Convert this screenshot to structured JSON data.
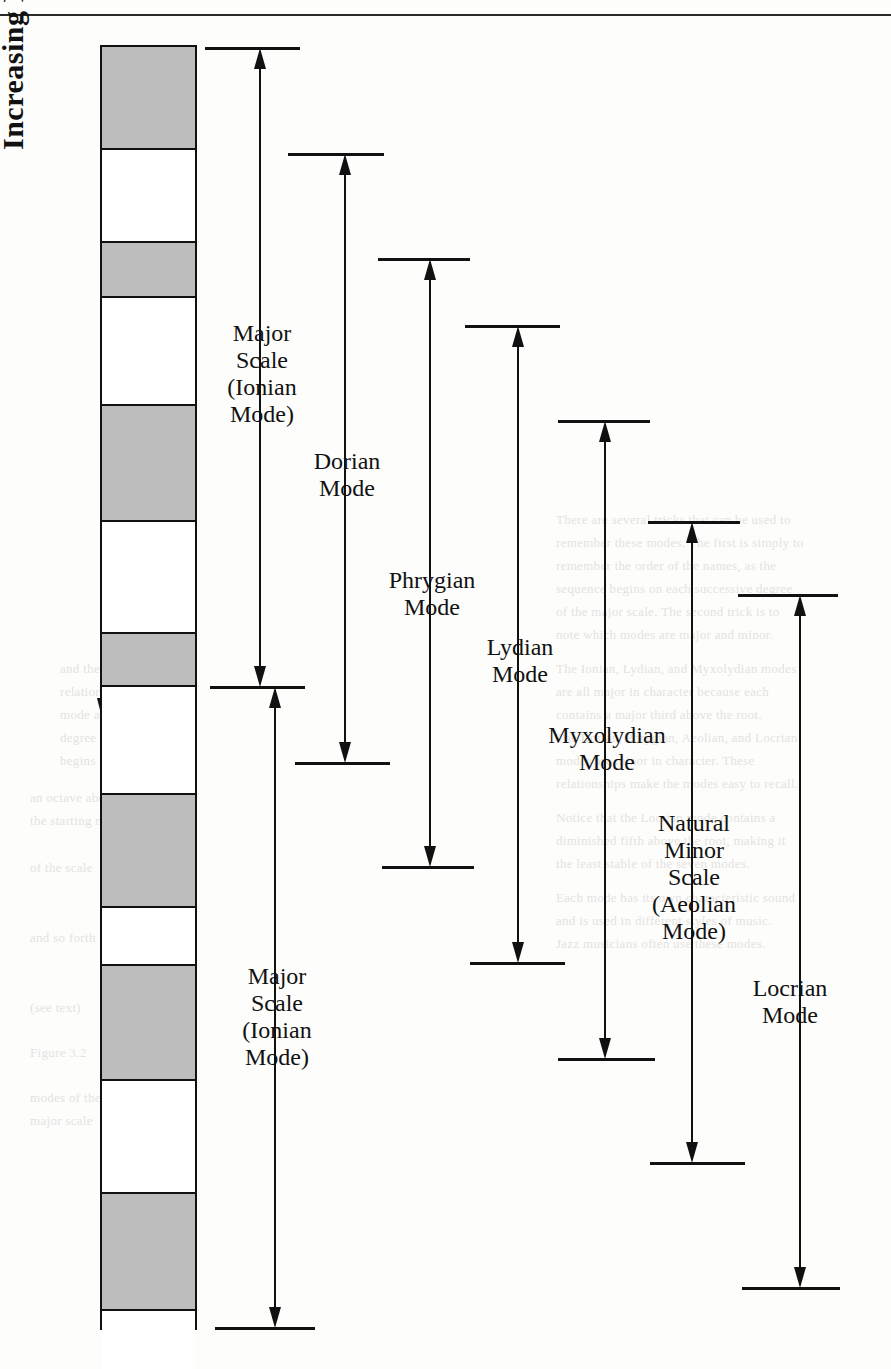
{
  "page": {
    "running_head": "",
    "pitch_axis_label": "Increasing Pitch"
  },
  "chart_data": {
    "type": "diagram",
    "title": "Increasing Pitch",
    "ladder": {
      "x": 100,
      "y": 45,
      "width": 97,
      "height": 1285,
      "segment_count": 13,
      "segments": [
        {
          "index": 0,
          "fill": "gray",
          "height": 103
        },
        {
          "index": 1,
          "fill": "white",
          "height": 93
        },
        {
          "index": 2,
          "fill": "gray",
          "height": 55
        },
        {
          "index": 3,
          "fill": "white",
          "height": 108
        },
        {
          "index": 4,
          "fill": "gray",
          "height": 116
        },
        {
          "index": 5,
          "fill": "white",
          "height": 112
        },
        {
          "index": 6,
          "fill": "gray",
          "height": 53
        },
        {
          "index": 7,
          "fill": "white",
          "height": 108
        },
        {
          "index": 8,
          "fill": "gray",
          "height": 113
        },
        {
          "index": 9,
          "fill": "white",
          "height": 58
        },
        {
          "index": 10,
          "fill": "gray",
          "height": 115
        },
        {
          "index": 11,
          "fill": "white",
          "height": 113
        },
        {
          "index": 12,
          "fill": "gray",
          "height": 117
        },
        {
          "index": 13,
          "fill": "white",
          "height": 58
        }
      ],
      "fill_colors": {
        "gray": "#bdbdbd",
        "white": "#ffffff",
        "outline": "#111111"
      }
    },
    "modes": [
      {
        "id": "major-ionian-upper",
        "label": "Major\nScale\n(Ionian\nMode)",
        "label_lines": [
          "Major",
          "Scale",
          "(Ionian",
          "Mode)"
        ],
        "axis_x": 260,
        "top_y": 47,
        "bottom_y": 686,
        "top_tick": {
          "x1": 205,
          "x2": 300
        },
        "bottom_tick": {
          "x1": 210,
          "x2": 305
        },
        "arrow_top": true,
        "arrow_bottom": true,
        "label_x": 262,
        "label_y": 320
      },
      {
        "id": "dorian",
        "label": "Dorian\nMode",
        "label_lines": [
          "Dorian",
          "Mode"
        ],
        "axis_x": 345,
        "top_y": 153,
        "bottom_y": 762,
        "top_tick": {
          "x1": 288,
          "x2": 384
        },
        "bottom_tick": {
          "x1": 295,
          "x2": 390
        },
        "arrow_top": true,
        "arrow_bottom": true,
        "label_x": 347,
        "label_y": 448
      },
      {
        "id": "phrygian",
        "label": "Phrygian\nMode",
        "label_lines": [
          "Phrygian",
          "Mode"
        ],
        "axis_x": 430,
        "top_y": 258,
        "bottom_y": 866,
        "top_tick": {
          "x1": 378,
          "x2": 470
        },
        "bottom_tick": {
          "x1": 382,
          "x2": 474
        },
        "arrow_top": true,
        "arrow_bottom": true,
        "label_x": 432,
        "label_y": 567
      },
      {
        "id": "lydian",
        "label": "Lydian\nMode",
        "label_lines": [
          "Lydian",
          "Mode"
        ],
        "axis_x": 518,
        "top_y": 325,
        "bottom_y": 962,
        "top_tick": {
          "x1": 465,
          "x2": 560
        },
        "bottom_tick": {
          "x1": 470,
          "x2": 565
        },
        "arrow_top": true,
        "arrow_bottom": true,
        "label_x": 520,
        "label_y": 634
      },
      {
        "id": "myxolydian",
        "label": "Myxolydian\nMode",
        "label_lines": [
          "Myxolydian",
          "Mode"
        ],
        "axis_x": 605,
        "top_y": 420,
        "bottom_y": 1058,
        "top_tick": {
          "x1": 558,
          "x2": 650
        },
        "bottom_tick": {
          "x1": 558,
          "x2": 655
        },
        "arrow_top": true,
        "arrow_bottom": true,
        "label_x": 607,
        "label_y": 722
      },
      {
        "id": "natural-minor-aeolian",
        "label": "Natural\nMinor\nScale\n(Aeolian\nMode)",
        "label_lines": [
          "Natural",
          "Minor",
          "Scale",
          "(Aeolian",
          "Mode)"
        ],
        "axis_x": 692,
        "top_y": 521,
        "bottom_y": 1162,
        "top_tick": {
          "x1": 648,
          "x2": 740
        },
        "bottom_tick": {
          "x1": 650,
          "x2": 745
        },
        "arrow_top": true,
        "arrow_bottom": true,
        "label_x": 694,
        "label_y": 810
      },
      {
        "id": "locrian",
        "label": "Locrian\nMode",
        "label_lines": [
          "Locrian",
          "Mode"
        ],
        "axis_x": 800,
        "top_y": 594,
        "bottom_y": 1287,
        "top_tick": {
          "x1": 738,
          "x2": 838
        },
        "bottom_tick": {
          "x1": 742,
          "x2": 840
        },
        "arrow_top": true,
        "arrow_bottom": true,
        "label_x": 790,
        "label_y": 975
      },
      {
        "id": "major-ionian-lower",
        "label": "Major\nScale\n(Ionian\nMode)",
        "label_lines": [
          "Major",
          "Scale",
          "(Ionian",
          "Mode)"
        ],
        "axis_x": 275,
        "top_y": 686,
        "bottom_y": 1327,
        "top_tick": null,
        "bottom_tick": {
          "x1": 215,
          "x2": 315
        },
        "arrow_top": true,
        "arrow_bottom": true,
        "label_x": 277,
        "label_y": 963
      }
    ],
    "pitch_axis": {
      "label": "Increasing Pitch",
      "direction": "downward-arrow",
      "x": 103,
      "top_y": 185,
      "bottom_y": 718
    }
  },
  "background_text": {
    "note": "faint bleed-through from reverse side of scanned page",
    "lines": [
      {
        "x": 556,
        "y": 512,
        "text": "There are several tricks that can be used to"
      },
      {
        "x": 556,
        "y": 535,
        "text": "remember these modes. The first is simply to"
      },
      {
        "x": 556,
        "y": 558,
        "text": "remember the order of the names, as the"
      },
      {
        "x": 556,
        "y": 581,
        "text": "sequence begins on each successive degree"
      },
      {
        "x": 556,
        "y": 604,
        "text": "of the major scale. The second trick is to"
      },
      {
        "x": 556,
        "y": 627,
        "text": "note which modes are major and minor."
      },
      {
        "x": 556,
        "y": 661,
        "text": "The Ionian, Lydian, and Myxolydian modes"
      },
      {
        "x": 556,
        "y": 684,
        "text": "are all major in character because each"
      },
      {
        "x": 556,
        "y": 707,
        "text": "contains a major third above the root."
      },
      {
        "x": 556,
        "y": 730,
        "text": "The Dorian, Phrygian, Aeolian, and Locrian"
      },
      {
        "x": 556,
        "y": 753,
        "text": "modes are minor in character. These"
      },
      {
        "x": 556,
        "y": 776,
        "text": "relationships make the modes easy to recall."
      },
      {
        "x": 556,
        "y": 810,
        "text": "Notice that the Locrian mode contains a"
      },
      {
        "x": 556,
        "y": 833,
        "text": "diminished fifth above the root, making it"
      },
      {
        "x": 556,
        "y": 856,
        "text": "the least stable of the seven modes."
      },
      {
        "x": 556,
        "y": 890,
        "text": "Each mode has its own characteristic sound"
      },
      {
        "x": 556,
        "y": 913,
        "text": "and is used in different styles of music."
      },
      {
        "x": 556,
        "y": 936,
        "text": "Jazz musicians often use these modes."
      },
      {
        "x": 60,
        "y": 661,
        "text": "and the figure shows the"
      },
      {
        "x": 60,
        "y": 684,
        "text": "relation between each"
      },
      {
        "x": 60,
        "y": 707,
        "text": "mode and the scale"
      },
      {
        "x": 60,
        "y": 730,
        "text": "degree on which it"
      },
      {
        "x": 60,
        "y": 753,
        "text": "begins in the octave."
      },
      {
        "x": 30,
        "y": 790,
        "text": "an octave above"
      },
      {
        "x": 30,
        "y": 813,
        "text": "the starting note"
      },
      {
        "x": 30,
        "y": 860,
        "text": "of the scale"
      },
      {
        "x": 30,
        "y": 930,
        "text": "and so forth"
      },
      {
        "x": 30,
        "y": 1000,
        "text": "(see text)"
      },
      {
        "x": 30,
        "y": 1045,
        "text": "Figure 3.2"
      },
      {
        "x": 30,
        "y": 1090,
        "text": "modes of the"
      },
      {
        "x": 30,
        "y": 1113,
        "text": "major scale"
      }
    ]
  }
}
